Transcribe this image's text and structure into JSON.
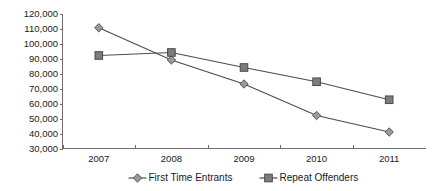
{
  "chart_data": {
    "type": "line",
    "title": "",
    "subtitle": "",
    "xlabel": "",
    "ylabel": "",
    "categories": [
      "2007",
      "2008",
      "2009",
      "2010",
      "2011"
    ],
    "series": [
      {
        "name": "First Time Entrants",
        "marker": "diamond",
        "values": [
          110500,
          89000,
          73000,
          52000,
          41000
        ]
      },
      {
        "name": "Repeat Offenders",
        "marker": "square",
        "values": [
          92000,
          94000,
          84000,
          74500,
          62500
        ]
      }
    ],
    "ylim": [
      30000,
      120000
    ],
    "ytick_step": 10000,
    "ytick_labels": [
      "120,000",
      "110,000",
      "100,000",
      "90,000",
      "80,000",
      "70,000",
      "60,000",
      "50,000",
      "40,000",
      "30,000"
    ],
    "grid": false,
    "legend_position": "bottom",
    "colors": {
      "line": "#4d4d4d",
      "diamond_fill": "#9a9a9a",
      "square_fill": "#7d7d7d",
      "axis": "#6e6e6e",
      "text": "#1a1a1a",
      "background": "#ffffff"
    }
  }
}
